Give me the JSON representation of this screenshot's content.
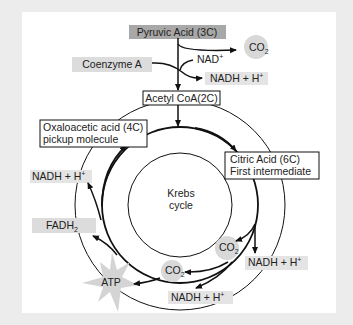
{
  "diagram": {
    "title": "Krebs cycle",
    "colors": {
      "background": "#ececec",
      "panel": "#ffffff",
      "pyruvic_fill": "#a8a8a8",
      "label_fill": "#dcdcdc",
      "co2_fill": "#d8d8d8",
      "atp_fill": "#d4d4d4",
      "line": "#111111"
    },
    "nodes": {
      "pyruvic_acid": "Pyruvic Acid (3C)",
      "co2_top": "CO",
      "co2_sub": "2",
      "nad_plus": "NAD",
      "nad_sup": "+",
      "coenzyme_a": "Coenzyme A",
      "nadh_top": "NADH + H",
      "nadh_top_sup": "+",
      "acetyl_coa": "Acetyl CoA(2C)",
      "oxaloacetic_line1": "Oxaloacetic acid (4C)",
      "oxaloacetic_line2": "pickup molecule",
      "citric_line1": "Citric Acid (6C)",
      "citric_line2": "First intermediate",
      "krebs_line1": "Krebs",
      "krebs_line2": "cycle",
      "nadh_left": "NADH + H",
      "nadh_left_sup": "+",
      "fadh2": "FADH",
      "fadh2_sub": "2",
      "atp": "ATP",
      "co2_right": "CO",
      "co2_right_sub": "2",
      "co2_bottom": "CO",
      "co2_bottom_sub": "2",
      "nadh_right": "NADH + H",
      "nadh_right_sup": "+",
      "nadh_bottom": "NADH + H",
      "nadh_bottom_sup": "+"
    }
  }
}
